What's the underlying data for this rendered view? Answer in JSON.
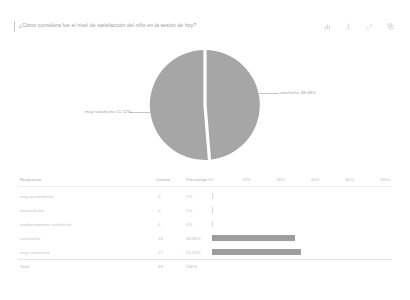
{
  "header": {
    "question": "¿Cómo considera fue el nivel de satisfacción del niño en la sesión de hoy?",
    "toolbar": [
      {
        "name": "chart-icon",
        "label": "Gráfico"
      },
      {
        "name": "download-icon",
        "label": "Descargar"
      },
      {
        "name": "link-icon",
        "label": "Enlace"
      },
      {
        "name": "copy-icon",
        "label": "Copiar"
      }
    ]
  },
  "pie": {
    "labels": {
      "left": "muy satisfecho  51.52%",
      "right": "satisfecho  48.48%"
    },
    "colors": {
      "slice": "#a6a6a6",
      "gap": "#ffffff"
    }
  },
  "table": {
    "columns": [
      "Respuesta",
      "Conteo",
      "Porcentaje"
    ],
    "ticks": [
      "0%",
      "20%",
      "40%",
      "60%",
      "80%",
      "100%"
    ],
    "rows": [
      {
        "label": "muy insatisfecho",
        "count": "0",
        "pct": "0%"
      },
      {
        "label": "insatisfecho",
        "count": "0",
        "pct": "0%"
      },
      {
        "label": "medianamente satisfecho",
        "count": "0",
        "pct": "0%"
      },
      {
        "label": "satisfecho",
        "count": "16",
        "pct": "48.48%"
      },
      {
        "label": "muy satisfecho",
        "count": "17",
        "pct": "51.52%"
      }
    ],
    "total": {
      "label": "Total",
      "count": "33",
      "pct": "100%"
    }
  },
  "chart_data": {
    "type": "pie",
    "title": "¿Cómo considera fue el nivel de satisfacción del niño en la sesión de hoy?",
    "categories": [
      "muy insatisfecho",
      "insatisfecho",
      "medianamente satisfecho",
      "satisfecho",
      "muy satisfecho"
    ],
    "values": [
      0,
      0,
      0,
      16,
      17
    ],
    "percentages": [
      0,
      0,
      0,
      48.48,
      51.52
    ],
    "total": 33,
    "legend_position": "callout-labels",
    "xlabel": "",
    "ylabel": "",
    "secondary": {
      "type": "bar",
      "orientation": "horizontal",
      "categories": [
        "muy insatisfecho",
        "insatisfecho",
        "medianamente satisfecho",
        "satisfecho",
        "muy satisfecho"
      ],
      "values": [
        0,
        0,
        0,
        48.48,
        51.52
      ],
      "xlim": [
        0,
        100
      ],
      "xticks": [
        0,
        20,
        40,
        60,
        80,
        100
      ],
      "grid": false
    }
  }
}
